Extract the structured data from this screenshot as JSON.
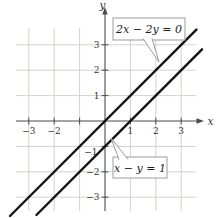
{
  "figure": {
    "width": 220,
    "height": 218,
    "background": "#ffffff",
    "origin_px": {
      "x": 105,
      "y": 121
    },
    "unit_px": 25.4,
    "grid": {
      "vertical_span_px": [
        28,
        211
      ],
      "horizontal_span_px": [
        16,
        196
      ]
    },
    "axis": {
      "x_label": "x",
      "y_label": "y",
      "x_line_px": [
        16,
        198
      ],
      "x_arrow_tip_px": 204,
      "y_line_px": [
        13,
        211
      ],
      "y_arrow_tip_px": 7,
      "tick_half_px": 3.4
    },
    "ticks": {
      "x": [
        {
          "v": -3,
          "label": "−3"
        },
        {
          "v": -2,
          "label": "−2"
        },
        {
          "v": -1,
          "label": ""
        },
        {
          "v": 1,
          "label": "1"
        },
        {
          "v": 2,
          "label": "2"
        },
        {
          "v": 3,
          "label": "3"
        }
      ],
      "y": [
        {
          "v": 3,
          "label": "3"
        },
        {
          "v": 2,
          "label": "2"
        },
        {
          "v": 1,
          "label": "1"
        },
        {
          "v": -1,
          "label": "−1",
          "dx": -2,
          "dy": 5
        },
        {
          "v": -2,
          "label": "−2"
        },
        {
          "v": -3,
          "label": "−3"
        }
      ]
    },
    "colors": {
      "grid": "#cfd4cd",
      "axis": "#4b4b4b",
      "plot_line": "#141414",
      "box_border": "#9b9b9b",
      "box_fill": "#ffffff",
      "tick_text": "#333333",
      "equation_text": "#1d1d1d"
    },
    "callouts": [
      {
        "text": "2x − 2y = 0",
        "box_px": {
          "x": 113,
          "y": 18,
          "w": 72,
          "h": 22
        },
        "wedge_px": {
          "base": [
            [
              143,
              38.5
            ],
            [
              152,
              38.5
            ]
          ],
          "tip": [
            159,
            62
          ]
        }
      },
      {
        "text": "x − y = 1",
        "box_px": {
          "x": 113,
          "y": 157,
          "w": 54,
          "h": 21
        },
        "wedge_px": {
          "base": [
            [
              119,
              159.5
            ],
            [
              128,
              159.5
            ]
          ],
          "tip": [
            111,
            138
          ]
        }
      }
    ]
  },
  "chart_data": {
    "type": "line",
    "title": "",
    "xlabel": "x",
    "ylabel": "y",
    "xlim": [
      -3.5,
      3.9
    ],
    "ylim": [
      -3.8,
      3.7
    ],
    "grid": true,
    "legend": "none",
    "x_ticks": [
      -3,
      -2,
      -1,
      1,
      2,
      3
    ],
    "y_ticks": [
      -3,
      -2,
      -1,
      1,
      2,
      3
    ],
    "series": [
      {
        "name": "2x − 2y = 0",
        "slope": 1,
        "y_intercept": 0,
        "passes_through": [
          [
            0,
            0
          ],
          [
            1,
            1
          ]
        ],
        "draw_endpoints": [
          [
            -3.74,
            -3.74
          ],
          [
            3.6,
            3.6
          ]
        ]
      },
      {
        "name": "x − y = 1",
        "slope": 1,
        "y_intercept": -1,
        "passes_through": [
          [
            1,
            0
          ],
          [
            0,
            -1
          ]
        ],
        "draw_endpoints": [
          [
            -2.7,
            -3.7
          ],
          [
            3.82,
            2.82
          ]
        ]
      }
    ],
    "annotations": [
      {
        "text": "2x − 2y = 0",
        "series": 0
      },
      {
        "text": "x − y = 1",
        "series": 1
      }
    ]
  }
}
